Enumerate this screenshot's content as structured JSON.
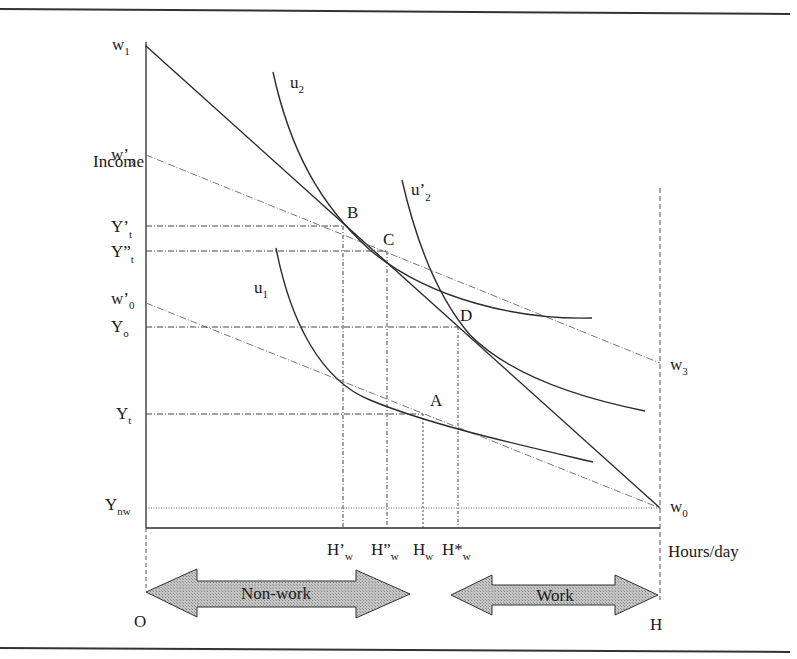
{
  "diagram": {
    "type": "labour-supply indifference curve diagram",
    "y_axis_label": "Income",
    "x_axis_label": "Hours/day",
    "origin_label": "O",
    "end_label": "H",
    "y_labels": [
      {
        "base": "w",
        "sub": "1",
        "id": "w1"
      },
      {
        "base": "w’",
        "sub": "3",
        "id": "w3prime"
      },
      {
        "base": "Y’",
        "sub": "t",
        "id": "Yt_prime"
      },
      {
        "base": "Y”",
        "sub": "t",
        "id": "Yt_dprime"
      },
      {
        "base": "w’",
        "sub": "0",
        "id": "w0prime"
      },
      {
        "base": "Y",
        "sub": "o",
        "id": "Yo"
      },
      {
        "base": "Y",
        "sub": "t",
        "id": "Yt"
      },
      {
        "base": "Y",
        "sub": "nw",
        "id": "Ynw"
      }
    ],
    "right_labels": [
      {
        "base": "w",
        "sub": "3",
        "id": "w3"
      },
      {
        "base": "w",
        "sub": "0",
        "id": "w0"
      }
    ],
    "x_labels": [
      {
        "base": "H’",
        "sub": "w",
        "id": "Hw_prime"
      },
      {
        "base": "H”",
        "sub": "w",
        "id": "Hw_dprime"
      },
      {
        "base": "H",
        "sub": "w",
        "id": "Hw"
      },
      {
        "base": "H*",
        "sub": "w",
        "id": "Hw_star"
      }
    ],
    "curves": [
      {
        "base": "u",
        "sub": "2",
        "id": "u2"
      },
      {
        "base": "u’",
        "sub": "2",
        "id": "u2prime"
      },
      {
        "base": "u",
        "sub": "1",
        "id": "u1"
      }
    ],
    "points": [
      "A",
      "B",
      "C",
      "D"
    ],
    "arrows": {
      "non_work": "Non-work",
      "work": "Work"
    },
    "colors": {
      "line": "#2b2b2b",
      "dotted": "#555555",
      "arrow_fill": "#b8b8b8",
      "rule": "#333333"
    }
  }
}
